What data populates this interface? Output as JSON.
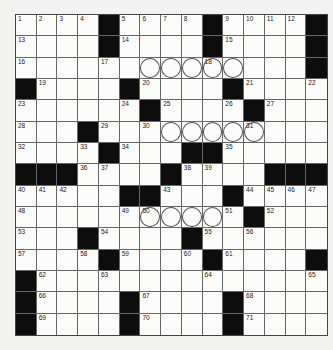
{
  "puzzle": {
    "rows": 15,
    "cols": 15,
    "grid": [
      "1 2 3 4 # 5 6 7 8 # 9 10 11 12 #",
      "13 . . . # 14 . . . # 15 . . . #",
      "16 . . . 17 . o o o 18o o . . . #",
      "# 19 . . . # 20 . . . # 21 . . 22",
      "23 . . . . 24 # 25 . . 26 # 27 . .",
      "28 . . # 29 . 30 o o o o 31o . . .",
      "32 . . 33 # 34 . . # # 35 . . . .",
      "# # # 36 37 . . # 38 39 . . # # #",
      "40 41 42 . . # # 43 . . # 44 45 46 47",
      "48 . . . . 49 50o o o o 51 # 52 . .",
      "53 . . # 54 . . . # 55 . 56 . . .",
      "57 . . 58 # 59 . . 60 # 61 . . . #",
      "# 62 . . 63 . . . . 64 . . . . 65",
      "# 66 . . . # 67 . . . # 68 . . .",
      "# 69 . . . # 70 . . . # 71 . . ."
    ],
    "circled_note": "cells marked 'o' contain circles"
  }
}
